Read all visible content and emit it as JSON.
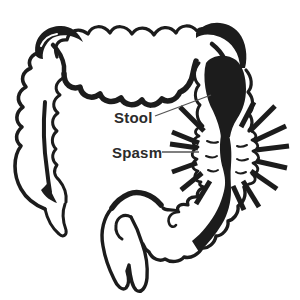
{
  "colors": {
    "ink": "#1c1c1c",
    "label": "#2b2b2b",
    "leader": "#555555",
    "background": "#ffffff"
  },
  "annotations": {
    "stool": {
      "label": "Stool"
    },
    "spasm": {
      "label": "Spasm"
    }
  }
}
